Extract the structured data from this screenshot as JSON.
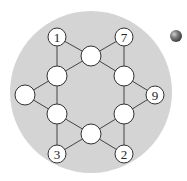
{
  "diagram": {
    "title": "",
    "background_circle": {
      "cx": 91,
      "cy": 92,
      "r": 81,
      "fill": "#d4d4d4"
    },
    "node_style": {
      "fill": "#ffffff",
      "stroke": "#333333",
      "stroke_width": 1
    },
    "edge_style": {
      "stroke": "#444444",
      "stroke_width": 1
    },
    "nodes": [
      {
        "id": "n1",
        "label": "1",
        "x": 57,
        "y": 37,
        "r": 9
      },
      {
        "id": "n7",
        "label": "7",
        "x": 124,
        "y": 37,
        "r": 9
      },
      {
        "id": "top",
        "label": "",
        "x": 91,
        "y": 56,
        "r": 10
      },
      {
        "id": "ul",
        "label": "",
        "x": 57,
        "y": 76,
        "r": 10
      },
      {
        "id": "ur",
        "label": "",
        "x": 124,
        "y": 76,
        "r": 10
      },
      {
        "id": "left",
        "label": "",
        "x": 25,
        "y": 95,
        "r": 10
      },
      {
        "id": "n9",
        "label": "9",
        "x": 155,
        "y": 95,
        "r": 9
      },
      {
        "id": "ll",
        "label": "",
        "x": 57,
        "y": 114,
        "r": 10
      },
      {
        "id": "lr",
        "label": "",
        "x": 124,
        "y": 114,
        "r": 10
      },
      {
        "id": "bot",
        "label": "",
        "x": 91,
        "y": 134,
        "r": 10
      },
      {
        "id": "n3",
        "label": "3",
        "x": 57,
        "y": 154,
        "r": 9
      },
      {
        "id": "n2",
        "label": "2",
        "x": 124,
        "y": 154,
        "r": 9
      }
    ],
    "edges": [
      [
        "n1",
        "ul"
      ],
      [
        "n1",
        "top"
      ],
      [
        "n7",
        "ur"
      ],
      [
        "n7",
        "top"
      ],
      [
        "top",
        "ul"
      ],
      [
        "top",
        "ur"
      ],
      [
        "ul",
        "left"
      ],
      [
        "ul",
        "ll"
      ],
      [
        "ur",
        "n9"
      ],
      [
        "ur",
        "lr"
      ],
      [
        "left",
        "ll"
      ],
      [
        "n9",
        "lr"
      ],
      [
        "ll",
        "bot"
      ],
      [
        "ll",
        "n3"
      ],
      [
        "lr",
        "bot"
      ],
      [
        "lr",
        "n2"
      ],
      [
        "bot",
        "n3"
      ],
      [
        "bot",
        "n2"
      ]
    ]
  },
  "decoration": {
    "sphere_icon": {
      "name": "globe-marker",
      "x": 176,
      "y": 36,
      "r": 6,
      "color": "#6a6a6a"
    }
  }
}
